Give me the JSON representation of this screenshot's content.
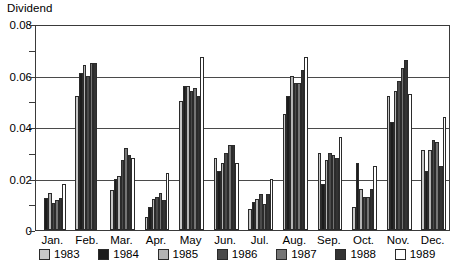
{
  "chart_data": {
    "type": "bar",
    "title": "",
    "ylabel": "Dividend",
    "xlabel": "",
    "ylim": [
      0,
      0.08
    ],
    "yticks": [
      "0",
      "0.02",
      "0.04",
      "0.06",
      "0.08"
    ],
    "ytick_values": [
      0,
      0.02,
      0.04,
      0.06,
      0.08
    ],
    "y_minor_ticks": [
      0.01,
      0.03,
      0.05,
      0.07
    ],
    "grid": true,
    "legend_position": "bottom",
    "categories": [
      "Jan.",
      "Feb.",
      "Mar.",
      "Apr.",
      "May",
      "Jun.",
      "Jul.",
      "Aug.",
      "Sep.",
      "Oct.",
      "Nov.",
      "Dec."
    ],
    "series": [
      {
        "name": "1983",
        "color": "#c8c8c8",
        "values": [
          0.0,
          0.052,
          0.0155,
          0.005,
          0.05,
          0.028,
          0.008,
          0.045,
          0.03,
          0.009,
          0.052,
          0.031
        ]
      },
      {
        "name": "1984",
        "color": "#1c1c1c",
        "values": [
          0.0125,
          0.061,
          0.02,
          0.009,
          0.056,
          0.023,
          0.011,
          0.052,
          0.018,
          0.026,
          0.042,
          0.023
        ]
      },
      {
        "name": "1985",
        "color": "#b4b4b4",
        "values": [
          0.0145,
          0.064,
          0.021,
          0.012,
          0.056,
          0.026,
          0.012,
          0.06,
          0.027,
          0.016,
          0.054,
          0.031
        ]
      },
      {
        "name": "1986",
        "color": "#4a4a4a",
        "values": [
          0.0105,
          0.06,
          0.027,
          0.013,
          0.054,
          0.03,
          0.014,
          0.057,
          0.03,
          0.013,
          0.058,
          0.035
        ]
      },
      {
        "name": "1987",
        "color": "#757575",
        "values": [
          0.0115,
          0.065,
          0.032,
          0.0145,
          0.055,
          0.033,
          0.01,
          0.057,
          0.029,
          0.013,
          0.063,
          0.034
        ]
      },
      {
        "name": "1988",
        "color": "#333333",
        "values": [
          0.0125,
          0.065,
          0.029,
          0.0115,
          0.052,
          0.033,
          0.014,
          0.062,
          0.028,
          0.016,
          0.066,
          0.025
        ]
      },
      {
        "name": "1989",
        "color": "#ffffff",
        "values": [
          0.018,
          0.0,
          0.028,
          0.022,
          0.067,
          0.026,
          0.02,
          0.067,
          0.036,
          0.025,
          0.053,
          0.044
        ]
      }
    ]
  }
}
